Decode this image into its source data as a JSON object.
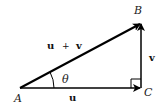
{
  "diagram": {
    "type": "vector-triangle",
    "points": {
      "A": {
        "label": "A",
        "x": 20,
        "y": 88
      },
      "B": {
        "label": "B",
        "x": 141,
        "y": 23
      },
      "C": {
        "label": "C",
        "x": 141,
        "y": 88
      }
    },
    "vectors": [
      {
        "name": "u",
        "from": "A",
        "to": "C",
        "label": "u"
      },
      {
        "name": "v",
        "from": "C",
        "to": "B",
        "label": "v"
      },
      {
        "name": "u+v",
        "from": "A",
        "to": "B",
        "label_u": "u",
        "label_plus": "+",
        "label_v": "v"
      }
    ],
    "angle_label": "θ",
    "right_angle_at": "C",
    "colors": {
      "stroke": "#000000",
      "text": "#222222",
      "background": "#ffffff"
    }
  }
}
